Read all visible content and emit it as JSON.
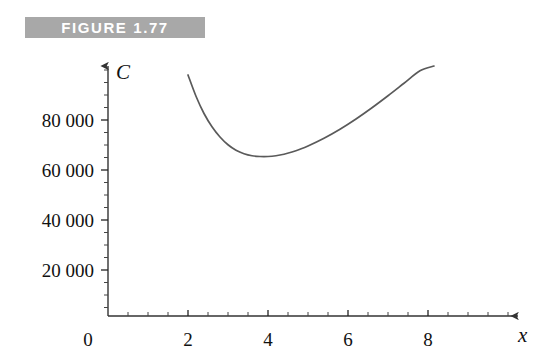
{
  "figure": {
    "label": "FIGURE 1.77",
    "band_color": "#a8a8a8",
    "label_color": "#ffffff"
  },
  "chart_data": {
    "type": "line",
    "title": "FIGURE 1.77",
    "xlabel": "x",
    "ylabel": "C",
    "xlim": [
      0,
      10.3
    ],
    "ylim": [
      0,
      101600
    ],
    "grid": false,
    "legend": null,
    "axis_style": "arrow-tipped axes with minor ticks",
    "line_color": "#5a5a5a",
    "xticks": [
      0,
      2,
      4,
      6,
      8
    ],
    "xtick_labels": [
      "0",
      "2",
      "4",
      "6",
      "8"
    ],
    "xminor_tick_step": 0.5,
    "yticks": [
      20000,
      40000,
      60000,
      80000
    ],
    "ytick_labels": [
      "20 000",
      "40 000",
      "60 000",
      "80 000"
    ],
    "yminor_tick_step": 5000,
    "series": [
      {
        "name": "C",
        "x": [
          2.0,
          2.2,
          2.4,
          2.6,
          2.8,
          3.0,
          3.2,
          3.4,
          3.6,
          3.8,
          4.0,
          4.2,
          4.4,
          4.6,
          4.8,
          5.0,
          5.4,
          5.8,
          6.2,
          6.6,
          7.0,
          7.4,
          7.8,
          8.15
        ],
        "values": [
          98000,
          89500,
          82600,
          77300,
          73200,
          70100,
          67900,
          66500,
          65700,
          65400,
          65400,
          65700,
          66300,
          67200,
          68300,
          69600,
          72700,
          76300,
          80400,
          84900,
          89700,
          94700,
          99700,
          101600
        ]
      }
    ]
  },
  "axes": {
    "y_axis_name": "C",
    "x_axis_name": "x"
  }
}
